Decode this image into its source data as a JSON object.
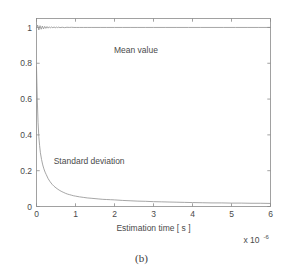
{
  "figure": {
    "caption": "(b)",
    "background_color": "#ffffff",
    "line_color": "#8f8f8f",
    "axis_color": "#8a8a8a",
    "text_color": "#4a4a4a"
  },
  "chart_data": {
    "type": "line",
    "title": "",
    "xlabel": "Estimation time [ s ]",
    "ylabel": "",
    "x_exponent_base": "x 10",
    "x_exponent_power": "-6",
    "xlim": [
      0,
      6
    ],
    "ylim": [
      0,
      1.05
    ],
    "xticks": [
      0,
      1,
      2,
      3,
      4,
      5,
      6
    ],
    "xticklabels": [
      "0",
      "1",
      "2",
      "3",
      "4",
      "5",
      "6"
    ],
    "yticks": [
      0,
      0.2,
      0.4,
      0.6,
      0.8,
      1
    ],
    "yticklabels": [
      "0",
      "0.2",
      "0.4",
      "0.6",
      "0.8",
      "1"
    ],
    "grid": false,
    "legend": "none",
    "annotations": [
      {
        "text": "Mean value",
        "x": 2.55,
        "y": 0.86
      },
      {
        "text": "Standard deviation",
        "x": 1.35,
        "y": 0.235
      }
    ],
    "series": [
      {
        "name": "Mean value",
        "x": [
          0.0,
          0.03,
          0.06,
          0.09,
          0.12,
          0.15,
          0.18,
          0.21,
          0.24,
          0.27,
          0.3,
          0.33,
          0.36,
          0.39,
          0.42,
          0.45,
          0.48,
          0.51,
          0.54,
          0.57,
          0.6,
          0.66,
          0.72,
          0.78,
          0.84,
          0.9,
          0.96,
          1.02,
          1.1,
          1.2,
          1.3,
          1.4,
          1.5,
          1.65,
          1.8,
          2.0,
          2.2,
          2.4,
          2.6,
          2.8,
          3.0,
          3.3,
          3.6,
          3.9,
          4.2,
          4.5,
          4.8,
          5.1,
          5.4,
          5.7,
          6.0
        ],
        "values": [
          0.998,
          1.013,
          0.986,
          1.01,
          0.99,
          1.008,
          0.992,
          1.006,
          0.995,
          1.005,
          0.996,
          1.004,
          0.997,
          1.003,
          0.998,
          1.003,
          0.998,
          1.002,
          0.999,
          1.002,
          0.999,
          1.001,
          0.999,
          1.001,
          1.0,
          1.001,
          1.0,
          1.0,
          1.0,
          1.0,
          1.0,
          1.0,
          1.0,
          1.0,
          1.0,
          1.0,
          1.0,
          1.0,
          1.0,
          1.0,
          1.0,
          1.0,
          1.0,
          1.0,
          1.0,
          1.0,
          1.0,
          1.0,
          1.0,
          1.0,
          1.0
        ]
      },
      {
        "name": "Standard deviation",
        "x": [
          0.0,
          0.02,
          0.04,
          0.06,
          0.08,
          0.1,
          0.13,
          0.16,
          0.19,
          0.22,
          0.25,
          0.3,
          0.35,
          0.4,
          0.45,
          0.5,
          0.55,
          0.6,
          0.65,
          0.7,
          0.75,
          0.8,
          0.85,
          0.9,
          0.95,
          1.0,
          1.1,
          1.2,
          1.3,
          1.4,
          1.5,
          1.6,
          1.7,
          1.8,
          1.9,
          2.0,
          2.2,
          2.4,
          2.6,
          2.8,
          3.0,
          3.2,
          3.4,
          3.6,
          3.8,
          4.0,
          4.25,
          4.5,
          4.75,
          5.0,
          5.25,
          5.5,
          5.75,
          6.0
        ],
        "values": [
          0.78,
          0.6,
          0.47,
          0.39,
          0.34,
          0.3,
          0.262,
          0.232,
          0.21,
          0.192,
          0.178,
          0.155,
          0.138,
          0.124,
          0.113,
          0.104,
          0.096,
          0.089,
          0.083,
          0.078,
          0.073,
          0.069,
          0.066,
          0.063,
          0.06,
          0.058,
          0.054,
          0.051,
          0.048,
          0.046,
          0.044,
          0.042,
          0.04,
          0.039,
          0.038,
          0.037,
          0.034,
          0.032,
          0.03,
          0.029,
          0.027,
          0.026,
          0.025,
          0.024,
          0.023,
          0.022,
          0.021,
          0.02,
          0.02,
          0.019,
          0.019,
          0.018,
          0.018,
          0.017
        ]
      }
    ]
  }
}
